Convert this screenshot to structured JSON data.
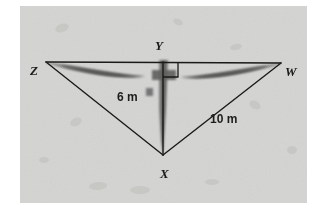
{
  "figure": {
    "kind": "geometry-diagram-hang-glider",
    "panel": {
      "background_color": "#d4d4d2",
      "page_background_color": "#ffffff",
      "left": 20,
      "top": 6,
      "width": 287,
      "height": 197
    },
    "colors": {
      "line": "#1a1a1a",
      "glider_dark": "#6e6e6e",
      "glider_darker": "#555555",
      "panel": "#d4d4d2",
      "text": "#1a1a1a"
    },
    "vertex_labels": [
      {
        "id": "Z",
        "text": "Z",
        "x": 46,
        "y": 62
      },
      {
        "id": "Y",
        "text": "Y",
        "x": 163,
        "y": 62
      },
      {
        "id": "W",
        "text": "W",
        "x": 281,
        "y": 63
      },
      {
        "id": "X",
        "text": "X",
        "x": 163,
        "y": 155
      }
    ],
    "measurements": [
      {
        "id": "YX",
        "text": "6 m",
        "segment": "Y to X",
        "value": 6,
        "unit": "m"
      },
      {
        "id": "XW",
        "text": "10 m",
        "segment": "X to W",
        "value": 10,
        "unit": "m"
      }
    ],
    "right_angle": {
      "at_vertex": "Y",
      "marker": "square",
      "between": "YX and YW"
    }
  }
}
